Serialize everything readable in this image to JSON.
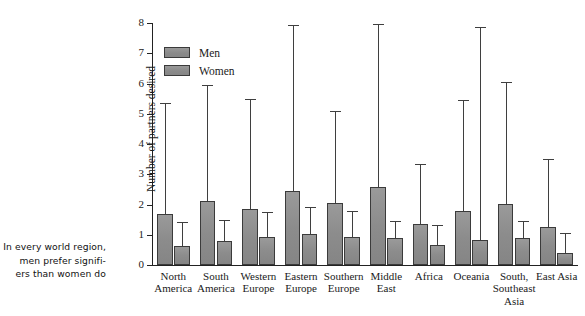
{
  "caption": {
    "lines": [
      "In every world region,",
      "men prefer signifi-",
      "ers than women do"
    ]
  },
  "legend": {
    "position": "top-left-inside",
    "entries": [
      {
        "label": "Men",
        "color": "#8d8d8d"
      },
      {
        "label": "Women",
        "color": "#8d8d8d"
      }
    ]
  },
  "axes": {
    "ylabel": "Number of partners desired",
    "yticks": [
      "0",
      "1",
      "2",
      "3",
      "4",
      "5",
      "6",
      "7",
      "8"
    ]
  },
  "chart_data": {
    "type": "bar",
    "title": "",
    "xlabel": "",
    "ylabel": "Number of partners desired",
    "ylim": [
      0,
      8
    ],
    "yticks": [
      0,
      1,
      2,
      3,
      4,
      5,
      6,
      7,
      8
    ],
    "grid": false,
    "legend_position": "upper left",
    "error_bars": "upper-only (one-sided whisker with cap)",
    "categories": [
      "North America",
      "South America",
      "Western Europe",
      "Eastern Europe",
      "Southern Europe",
      "Middle East",
      "Africa",
      "Oceania",
      "South, Southeast Asia",
      "East Asia"
    ],
    "category_label_lines": [
      [
        "North",
        "America"
      ],
      [
        "South",
        "America"
      ],
      [
        "Western",
        "Europe"
      ],
      [
        "Eastern",
        "Europe"
      ],
      [
        "Southern",
        "Europe"
      ],
      [
        "Middle",
        "East"
      ],
      [
        "Africa"
      ],
      [
        "Oceania"
      ],
      [
        "South,",
        "Southeast",
        "Asia"
      ],
      [
        "East Asia"
      ]
    ],
    "series": [
      {
        "name": "Men",
        "color": "#8d8d8d",
        "values": [
          1.69,
          2.13,
          1.85,
          2.46,
          2.05,
          2.58,
          1.36,
          1.8,
          2.03,
          1.26
        ],
        "error_upper": [
          5.36,
          5.95,
          5.5,
          7.95,
          5.08,
          7.96,
          3.33,
          5.45,
          6.06,
          3.5
        ]
      },
      {
        "name": "Women",
        "color": "#8d8d8d",
        "values": [
          0.63,
          0.8,
          0.93,
          1.02,
          0.92,
          0.89,
          0.65,
          0.83,
          0.88,
          0.39
        ],
        "error_upper": [
          1.42,
          1.48,
          1.76,
          1.91,
          1.8,
          1.45,
          1.32,
          7.86,
          1.47,
          1.06
        ]
      }
    ]
  }
}
